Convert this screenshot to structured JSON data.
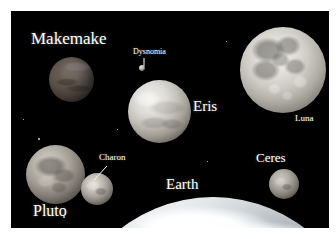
{
  "figure": {
    "background_color": "#000000",
    "border_color": "#ffffff",
    "label_color": "#ffffff"
  },
  "labels": {
    "makemake": "Makemake",
    "dysnomia": "Dysnomia",
    "eris": "Eris",
    "luna": "Luna",
    "pluto": "Pluto",
    "charon": "Charon",
    "earth": "Earth",
    "ceres": "Ceres"
  },
  "bodies": [
    {
      "name": "Makemake",
      "kind": "dwarf-planet",
      "cx": 60,
      "cy": 68,
      "diameter_px": 45
    },
    {
      "name": "Eris",
      "kind": "dwarf-planet",
      "cx": 148,
      "cy": 100,
      "diameter_px": 63
    },
    {
      "name": "Dysnomia",
      "kind": "moon",
      "cx": 131,
      "cy": 57,
      "diameter_px": 6
    },
    {
      "name": "Luna",
      "kind": "moon",
      "cx": 272,
      "cy": 59,
      "diameter_px": 86
    },
    {
      "name": "Pluto",
      "kind": "dwarf-planet",
      "cx": 44,
      "cy": 163,
      "diameter_px": 59
    },
    {
      "name": "Charon",
      "kind": "moon",
      "cx": 86,
      "cy": 178,
      "diameter_px": 32
    },
    {
      "name": "Ceres",
      "kind": "dwarf-planet",
      "cx": 273,
      "cy": 173,
      "diameter_px": 30
    },
    {
      "name": "Earth",
      "kind": "planet",
      "cx": 202,
      "cy": 336,
      "diameter_px": 300
    }
  ],
  "leader_lines": [
    {
      "label": "Dysnomia",
      "from_x": 133,
      "from_y": 47,
      "to_x": 133,
      "to_y": 55
    },
    {
      "label": "Charon",
      "from_x": 96,
      "from_y": 155,
      "to_x": 84,
      "to_y": 168
    }
  ]
}
